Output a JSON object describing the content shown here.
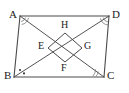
{
  "figure": {
    "background_color": "#ffffff",
    "stroke_color": "#4a4a4a",
    "label_color": "#1a1a1a",
    "vertices": [
      {
        "name": "A",
        "label": "A",
        "x": 20,
        "y": 16,
        "px": 27,
        "py": 16,
        "label_x": 9,
        "label_y": 9
      },
      {
        "name": "D",
        "label": "D",
        "x": 109,
        "y": 16,
        "px": 105,
        "py": 16,
        "label_x": 112,
        "label_y": 9
      },
      {
        "name": "B",
        "label": "B",
        "x": 14,
        "y": 77,
        "px": 22,
        "py": 77,
        "label_x": 4,
        "label_y": 70
      },
      {
        "name": "C",
        "label": "C",
        "x": 104,
        "y": 77,
        "px": 99,
        "py": 77,
        "label_x": 107,
        "label_y": 70
      }
    ],
    "inner_points": [
      {
        "name": "E",
        "label": "E",
        "x": 48,
        "y": 48,
        "label_x": 38,
        "label_y": 41
      },
      {
        "name": "H",
        "label": "H",
        "x": 65,
        "y": 33,
        "label_x": 61,
        "label_y": 20
      },
      {
        "name": "G",
        "label": "G",
        "x": 82,
        "y": 48,
        "label_x": 84,
        "label_y": 41
      },
      {
        "name": "F",
        "label": "F",
        "x": 65,
        "y": 62,
        "label_x": 61,
        "label_y": 63
      }
    ],
    "segments": [
      {
        "name": "side-AD",
        "from": "A",
        "to": "D"
      },
      {
        "name": "side-AB",
        "from": "A",
        "to": "B"
      },
      {
        "name": "side-BC",
        "from": "B",
        "to": "C"
      },
      {
        "name": "side-DC",
        "from": "D",
        "to": "C"
      },
      {
        "name": "diagonal-AC",
        "from": "A",
        "to": "C"
      },
      {
        "name": "diagonal-BD",
        "from": "B",
        "to": "D"
      },
      {
        "name": "rhombus-EH",
        "from": "E",
        "to": "H"
      },
      {
        "name": "rhombus-HG",
        "from": "H",
        "to": "G"
      },
      {
        "name": "rhombus-GF",
        "from": "G",
        "to": "F"
      },
      {
        "name": "rhombus-FE",
        "from": "F",
        "to": "E"
      }
    ],
    "angle_marks": [
      {
        "name": "angle-mark-A",
        "at": "A",
        "style": "double-arc",
        "count": 2
      },
      {
        "name": "angle-mark-D",
        "at": "D",
        "style": "double-arc",
        "count": 2
      },
      {
        "name": "angle-mark-B",
        "at": "B",
        "style": "dots",
        "count": 2
      },
      {
        "name": "angle-mark-C",
        "at": "C",
        "style": "double-arc",
        "count": 2
      }
    ]
  }
}
